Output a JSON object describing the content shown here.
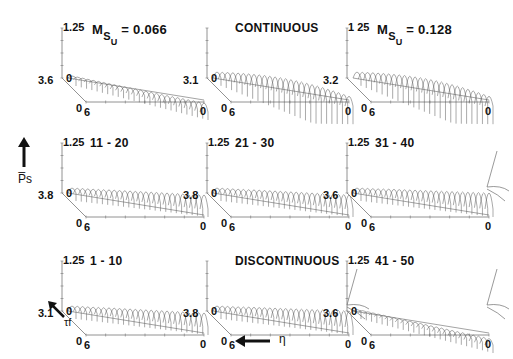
{
  "figure": {
    "y_axis_label": "P̅s",
    "depth_axis_label": "τf",
    "x_axis_label": "η"
  },
  "panels": [
    {
      "title": "M",
      "title_sub": "S",
      "title_subsub": "U",
      "title_value": "= 0.066",
      "y_max": "1.25",
      "y_zero": "0",
      "depth_max": "3.6",
      "depth_zero": "0",
      "x_left": "6",
      "x_right": "0",
      "style": "flat"
    },
    {
      "title": "CONTINUOUS",
      "y_max": "",
      "y_zero": "0",
      "depth_max": "3.1",
      "depth_zero": "0",
      "x_left": "6",
      "x_right": "0",
      "style": "arch"
    },
    {
      "title": "M",
      "title_sub": "S",
      "title_subsub": "U",
      "title_value": "= 0.128",
      "y_max": "1 25",
      "y_zero": "",
      "depth_max": "3.2",
      "depth_zero": "0",
      "x_left": "6",
      "x_right": "0",
      "style": "arch"
    },
    {
      "title": "11 - 20",
      "y_max": "1.25",
      "y_zero": "0",
      "depth_max": "3.8",
      "depth_zero": "0",
      "x_left": "6",
      "x_right": "0",
      "style": "ramp"
    },
    {
      "title": "21 - 30",
      "y_max": "1.25",
      "y_zero": "0",
      "depth_max": "3.8",
      "depth_zero": "0",
      "x_left": "6",
      "x_right": "0",
      "style": "ramp"
    },
    {
      "title": "31 - 40",
      "y_max": "1.25",
      "y_zero": "0",
      "depth_max": "3.6",
      "depth_zero": "0",
      "x_left": "6",
      "x_right": "0",
      "style": "spike"
    },
    {
      "title": "1 - 10",
      "y_max": "1.25",
      "y_zero": "0",
      "depth_max": "3.1",
      "depth_zero": "0",
      "x_left": "6",
      "x_right": "0",
      "style": "ramp"
    },
    {
      "title": "DISCONTINUOUS",
      "y_max": "",
      "y_zero": "0",
      "depth_max": "3.8",
      "depth_zero": "0",
      "x_left": "6",
      "x_right": "0",
      "style": "spike"
    },
    {
      "title": "41 - 50",
      "y_max": "1.25",
      "y_zero": "0",
      "depth_max": "3.6",
      "depth_zero": "0",
      "x_left": "6",
      "x_right": "0",
      "style": "flatspike"
    }
  ],
  "chart_data": {
    "type": "3d-waterfall-grid",
    "title": "",
    "layout": {
      "rows": 3,
      "cols": 3
    },
    "axes": {
      "vertical": {
        "label": "P̅s",
        "range": [
          0,
          1.25
        ]
      },
      "depth": {
        "label": "τf",
        "range_note": "0 to panel-specific max (3.1-3.8)"
      },
      "horizontal": {
        "label": "η",
        "range": [
          6,
          0
        ],
        "direction": "decreasing to the left"
      }
    },
    "panels": [
      {
        "title": "MSU = 0.066",
        "row": 1,
        "col": 1,
        "tau_f_max": 3.6,
        "p_max": 1.25
      },
      {
        "title": "CONTINUOUS",
        "row": 1,
        "col": 2,
        "tau_f_max": 3.1
      },
      {
        "title": "MSU = 0.128",
        "row": 1,
        "col": 3,
        "tau_f_max": 3.2,
        "p_max": 1.25
      },
      {
        "title": "11 - 20",
        "row": 2,
        "col": 1,
        "tau_f_max": 3.8,
        "p_max": 1.25
      },
      {
        "title": "21 - 30",
        "row": 2,
        "col": 2,
        "tau_f_max": 3.8,
        "p_max": 1.25
      },
      {
        "title": "31 - 40",
        "row": 2,
        "col": 3,
        "tau_f_max": 3.6,
        "p_max": 1.25
      },
      {
        "title": "1 - 10",
        "row": 3,
        "col": 1,
        "tau_f_max": 3.1,
        "p_max": 1.25
      },
      {
        "title": "DISCONTINUOUS",
        "row": 3,
        "col": 2,
        "tau_f_max": 3.8
      },
      {
        "title": "41 - 50",
        "row": 3,
        "col": 3,
        "tau_f_max": 3.6,
        "p_max": 1.25
      }
    ],
    "grid": false,
    "legend": null
  }
}
